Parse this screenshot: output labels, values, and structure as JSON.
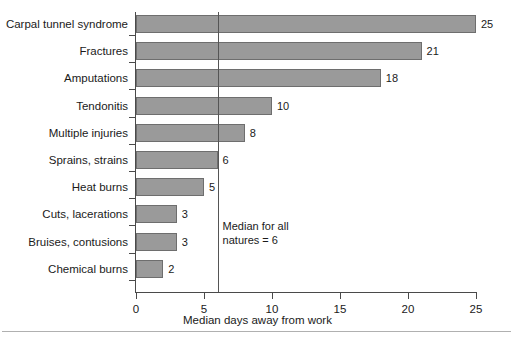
{
  "chart_data": {
    "type": "bar",
    "orientation": "horizontal",
    "title": "",
    "xlabel": "Median days away from work",
    "ylabel": "",
    "xlim": [
      0,
      25
    ],
    "xticks": [
      0,
      5,
      10,
      15,
      20,
      25
    ],
    "grid": false,
    "legend": null,
    "bar_color": "#9a9a9a",
    "bar_edge_color": "#6e6e6e",
    "categories": [
      "Carpal tunnel syndrome",
      "Fractures",
      "Amputations",
      "Tendonitis",
      "Multiple injuries",
      "Sprains, strains",
      "Heat burns",
      "Cuts, lacerations",
      "Bruises, contusions",
      "Chemical burns"
    ],
    "values": [
      25,
      21,
      18,
      10,
      8,
      6,
      5,
      3,
      3,
      2
    ],
    "value_labels": [
      "25",
      "21",
      "18",
      "10",
      "8",
      "6",
      "5",
      "3",
      "3",
      "2"
    ],
    "annotations": [
      {
        "name": "median-reference",
        "line_value": 6,
        "line_color": "#555555",
        "text_line1": "Median for all",
        "text_line2": "natures = 6"
      }
    ]
  },
  "axis": {
    "x_tick_labels": [
      "0",
      "5",
      "10",
      "15",
      "20",
      "25"
    ],
    "x_title": "Median days away from work"
  }
}
